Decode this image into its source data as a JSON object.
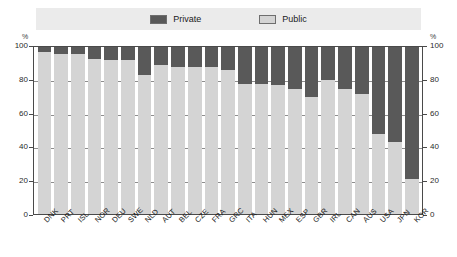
{
  "legend": {
    "items": [
      {
        "label": "Private",
        "color": "#595959",
        "name": "legend-private"
      },
      {
        "label": "Public",
        "color": "#d4d4d4",
        "name": "legend-public"
      }
    ]
  },
  "axis": {
    "unit_left": "%",
    "unit_right": "%",
    "ticks": [
      "100",
      "80",
      "60",
      "40",
      "20",
      "0"
    ]
  },
  "chart_data": {
    "type": "bar",
    "stacked": true,
    "stack_total": 100,
    "title": "",
    "subtitle": "",
    "xlabel": "",
    "ylabel": "%",
    "ylim": [
      0,
      100
    ],
    "yticks": [
      0,
      20,
      40,
      60,
      80,
      100
    ],
    "grid": true,
    "legend_position": "top-center",
    "categories": [
      "DNK",
      "PRT",
      "ISL",
      "NOR",
      "DEU",
      "SWE",
      "NLD",
      "AUT",
      "BEL",
      "CZE",
      "FRA",
      "GRC",
      "ITA",
      "HUN",
      "MEX",
      "ESP",
      "GBR",
      "IRL",
      "CAN",
      "AUS",
      "USA",
      "JPN",
      "KOR"
    ],
    "series": [
      {
        "name": "Private",
        "color": "#595959",
        "values": [
          3,
          4,
          4,
          7,
          8,
          8,
          17,
          11,
          12,
          12,
          12,
          14,
          22,
          22,
          23,
          25,
          30,
          20,
          25,
          28,
          52,
          57,
          79
        ]
      },
      {
        "name": "Public",
        "color": "#d4d4d4",
        "values": [
          97,
          96,
          96,
          93,
          92,
          92,
          83,
          89,
          88,
          88,
          88,
          86,
          78,
          78,
          77,
          75,
          70,
          80,
          75,
          72,
          48,
          43,
          21
        ]
      }
    ]
  }
}
